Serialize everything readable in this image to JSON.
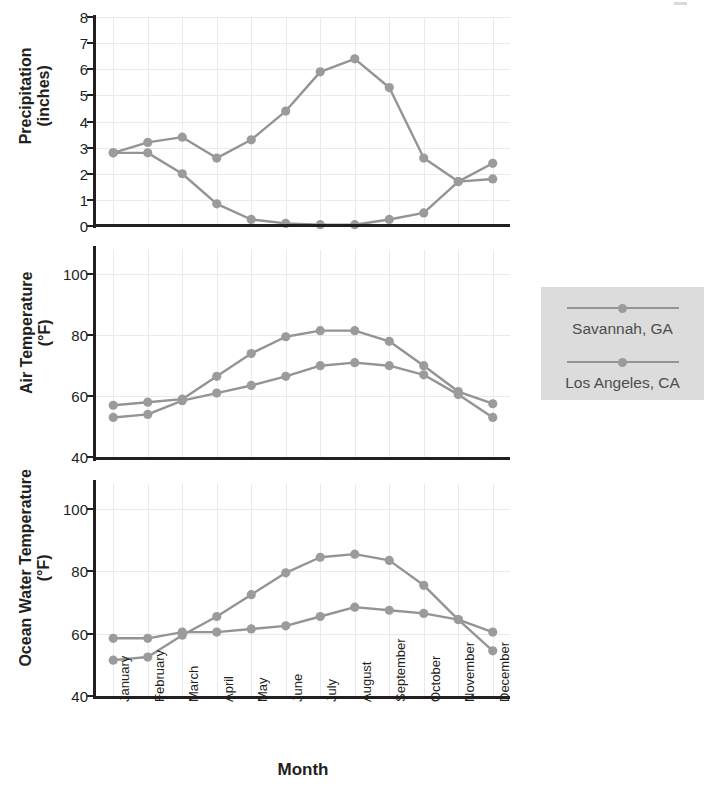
{
  "chart_data": [
    {
      "type": "line",
      "title": "Precipitation",
      "ylabel": "Precipitation\n(inches)",
      "ylabel_line1": "Precipitation",
      "ylabel_line2": "(inches)",
      "xlabel": "",
      "ylim": [
        0,
        8
      ],
      "yticks": [
        0,
        1,
        2,
        3,
        4,
        5,
        6,
        7,
        8
      ],
      "grid": true,
      "legend_position": "right",
      "categories": [
        "January",
        "February",
        "March",
        "April",
        "May",
        "June",
        "July",
        "August",
        "September",
        "October",
        "November",
        "December"
      ],
      "series": [
        {
          "name": "Savannah, GA",
          "values": [
            2.8,
            3.2,
            3.4,
            2.6,
            3.3,
            4.4,
            5.9,
            6.4,
            5.3,
            2.6,
            1.7,
            2.4
          ]
        },
        {
          "name": "Los Angeles, CA",
          "values": [
            2.8,
            2.8,
            2.0,
            0.85,
            0.25,
            0.1,
            0.05,
            0.05,
            0.25,
            0.5,
            1.7,
            1.8
          ]
        }
      ]
    },
    {
      "type": "line",
      "title": "Air Temperature",
      "ylabel": "Air Temperature\n(°F)",
      "ylabel_line1": "Air Temperature",
      "ylabel_line2": "(°F)",
      "xlabel": "",
      "ylim": [
        40,
        108
      ],
      "yticks": [
        40,
        60,
        80,
        100
      ],
      "grid": true,
      "legend_position": "right",
      "categories": [
        "January",
        "February",
        "March",
        "April",
        "May",
        "June",
        "July",
        "August",
        "September",
        "October",
        "November",
        "December"
      ],
      "series": [
        {
          "name": "Savannah, GA",
          "values": [
            57,
            58,
            59,
            66.5,
            74,
            79.5,
            81.5,
            81.5,
            78,
            70,
            61.5,
            57.5
          ]
        },
        {
          "name": "Los Angeles, CA",
          "values": [
            53,
            54,
            58.5,
            61,
            63.5,
            66.5,
            70,
            71,
            70,
            67,
            60.5,
            53
          ]
        }
      ]
    },
    {
      "type": "line",
      "title": "Ocean Water Temperature",
      "ylabel": "Ocean Water Temperature\n(°F)",
      "ylabel_line1": "Ocean Water Temperature",
      "ylabel_line2": "(°F)",
      "xlabel": "Month",
      "ylim": [
        40,
        108
      ],
      "yticks": [
        40,
        60,
        80,
        100
      ],
      "grid": true,
      "legend_position": "right",
      "categories": [
        "January",
        "February",
        "March",
        "April",
        "May",
        "June",
        "July",
        "August",
        "September",
        "October",
        "November",
        "December"
      ],
      "series": [
        {
          "name": "Savannah, GA",
          "values": [
            51.5,
            52.5,
            59.5,
            65.5,
            72.5,
            79.5,
            84.5,
            85.5,
            83.5,
            75.5,
            64.5,
            54.5
          ]
        },
        {
          "name": "Los Angeles, CA",
          "values": [
            58.5,
            58.5,
            60.5,
            60.5,
            61.5,
            62.5,
            65.5,
            68.5,
            67.5,
            66.5,
            64.5,
            60.5
          ]
        }
      ]
    }
  ],
  "axis": {
    "x_title": "Month",
    "months": [
      "January",
      "February",
      "March",
      "April",
      "May",
      "June",
      "July",
      "August",
      "September",
      "October",
      "November",
      "December"
    ]
  },
  "panels": [
    {
      "ylabel_line1": "Precipitation",
      "ylabel_line2": "(inches)"
    },
    {
      "ylabel_line1": "Air Temperature",
      "ylabel_line2": "(°F)"
    },
    {
      "ylabel_line1": "Ocean Water Temperature",
      "ylabel_line2": "(°F)"
    }
  ],
  "legend": {
    "entries": [
      {
        "label": "Savannah, GA",
        "marker": "line-circle-marker",
        "color": "#949494"
      },
      {
        "label": "Los Angeles, CA",
        "marker": "line-circle-marker",
        "color": "#949494"
      }
    ],
    "background": "#dcdcdc"
  },
  "colors": {
    "series_line": "#949494",
    "series_marker": "#9b9b9b",
    "axis": "#231f20",
    "grid": "#e9eaee",
    "legend_bg": "#dcdcdc",
    "legend_text": "#4d4d4d",
    "page_bg": "#ffffff"
  },
  "ticklabels": {
    "precip": [
      "8",
      "7",
      "6",
      "5",
      "4",
      "3",
      "2",
      "1",
      "0"
    ],
    "airtemp": [
      "100",
      "80",
      "60",
      "40"
    ],
    "oceantemp": [
      "100",
      "80",
      "60",
      "40"
    ]
  }
}
